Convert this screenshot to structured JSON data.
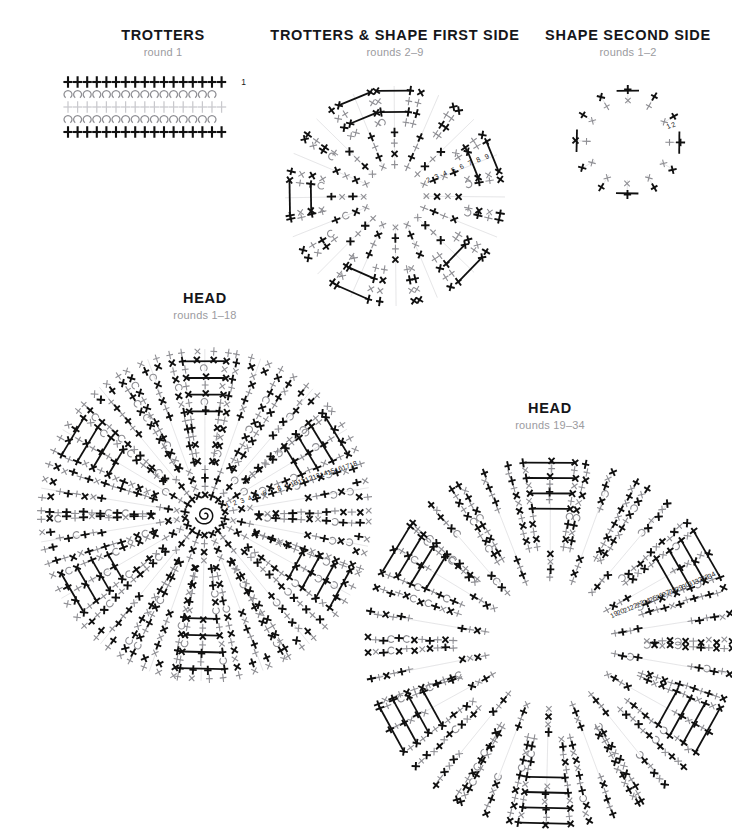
{
  "document": {
    "kind": "crochet-stitch-chart-sheet",
    "background_color": "#ffffff"
  },
  "palette": {
    "ink_dark": "#15161a",
    "stitch_black": "#101010",
    "stitch_gray": "#8e8e93",
    "stitch_light": "#c9c9cd",
    "subtitle_gray": "#9b9ba0"
  },
  "legend_symbols": {
    "single_crochet": "+",
    "crossed_single_crochet": "x",
    "chain_loop": "U",
    "magic_ring": "spiral"
  },
  "panels": [
    {
      "id": "trotters",
      "title": "TROTTERS",
      "subtitle": "round 1",
      "layout": "rows",
      "round_labels": [
        "1"
      ],
      "chart_data": {
        "type": "chart",
        "rows": [
          {
            "symbol": "+",
            "count": 17,
            "color": "#101010",
            "weight": "bold"
          },
          {
            "symbol": "U",
            "count": 16,
            "color": "#8e8e93",
            "weight": "normal"
          },
          {
            "symbol": "+",
            "count": 17,
            "color": "#c9c9cd",
            "weight": "normal"
          },
          {
            "symbol": "U",
            "count": 16,
            "color": "#8e8e93",
            "weight": "normal"
          },
          {
            "symbol": "+",
            "count": 17,
            "color": "#101010",
            "weight": "bold"
          }
        ]
      }
    },
    {
      "id": "trotters-shape-first-side",
      "title": "TROTTERS & SHAPE FIRST SIDE",
      "subtitle": "rounds 2–9",
      "layout": "radial",
      "round_labels": [
        "2",
        "3",
        "4",
        "5",
        "6",
        "7",
        "8",
        "9"
      ],
      "chart_data": {
        "type": "radial",
        "arms": 16,
        "rounds": 8,
        "inner_radius": 26,
        "outer_radius": 112,
        "has_center_ring": false,
        "round_colors": [
          "#8e8e93",
          "#101010",
          "#8e8e93",
          "#101010",
          "#8e8e93",
          "#101010",
          "#8e8e93",
          "#101010"
        ],
        "label_angle_deg": -22,
        "label_start_radius": 34
      }
    },
    {
      "id": "shape-second-side",
      "title": "SHAPE SECOND SIDE",
      "subtitle": "rounds 1–2",
      "layout": "radial",
      "round_labels": [
        "1",
        "2"
      ],
      "chart_data": {
        "type": "radial",
        "arms": 12,
        "rounds": 2,
        "inner_radius": 36,
        "outer_radius": 58,
        "has_center_ring": false,
        "round_colors": [
          "#8e8e93",
          "#101010"
        ],
        "label_angle_deg": -18,
        "label_start_radius": 42
      }
    },
    {
      "id": "head-rounds-1-18",
      "title": "HEAD",
      "subtitle": "rounds 1–18",
      "layout": "radial",
      "round_labels": [
        "1",
        "2",
        "3",
        "4",
        "5",
        "6",
        "7",
        "8",
        "9",
        "10",
        "11",
        "12",
        "13",
        "14",
        "15",
        "16",
        "17",
        "18"
      ],
      "chart_data": {
        "type": "radial",
        "arms": 18,
        "rounds": 18,
        "inner_radius": 16,
        "outer_radius": 168,
        "has_center_ring": true,
        "round_colors": [
          "#101010",
          "#8e8e93",
          "#101010",
          "#8e8e93",
          "#101010",
          "#8e8e93",
          "#101010",
          "#8e8e93",
          "#101010",
          "#8e8e93",
          "#101010",
          "#8e8e93",
          "#101010",
          "#8e8e93",
          "#101010",
          "#8e8e93",
          "#101010",
          "#8e8e93"
        ],
        "label_angle_deg": -18,
        "label_start_radius": 22
      }
    },
    {
      "id": "head-rounds-19-34",
      "title": "HEAD",
      "subtitle": "rounds 19–34",
      "layout": "radial",
      "round_labels": [
        "19",
        "20",
        "21",
        "22",
        "23",
        "24",
        "25",
        "26",
        "27",
        "28",
        "29",
        "30",
        "31",
        "32",
        "33",
        "34"
      ],
      "chart_data": {
        "type": "radial",
        "arms": 18,
        "rounds": 16,
        "inner_radius": 62,
        "outer_radius": 186,
        "has_center_ring": false,
        "round_colors": [
          "#8e8e93",
          "#101010",
          "#8e8e93",
          "#101010",
          "#8e8e93",
          "#101010",
          "#8e8e93",
          "#101010",
          "#8e8e93",
          "#101010",
          "#8e8e93",
          "#101010",
          "#8e8e93",
          "#101010",
          "#8e8e93",
          "#101010"
        ],
        "label_angle_deg": -22,
        "label_start_radius": 68
      }
    }
  ]
}
